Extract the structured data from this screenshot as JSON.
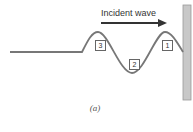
{
  "diagram": {
    "arrow_label": "Incident wave",
    "caption": "(a)",
    "labels": [
      {
        "id": "1",
        "text": "1"
      },
      {
        "id": "2",
        "text": "2"
      },
      {
        "id": "3",
        "text": "3"
      }
    ],
    "colors": {
      "wave": "#777777",
      "wall_fill": "#c8c8c8",
      "wall_stroke": "#999999",
      "arrow": "#333333"
    }
  }
}
